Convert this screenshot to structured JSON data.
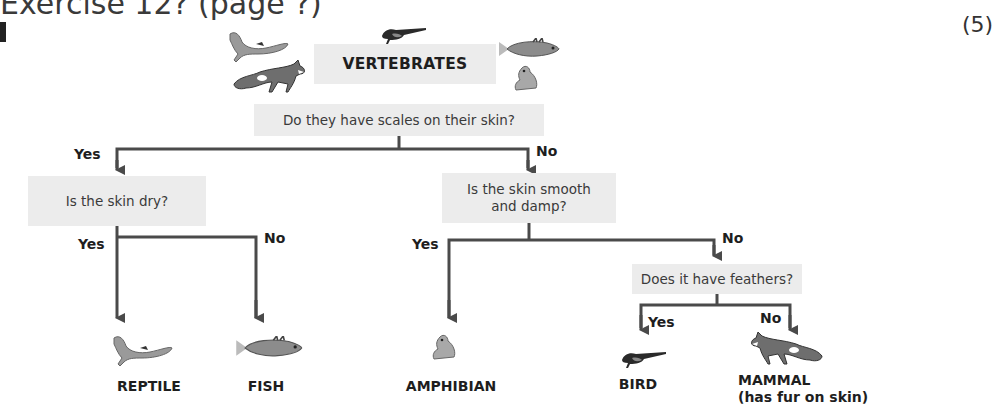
{
  "header": {
    "title_fragment": "Exercise 12?  (page ?)",
    "marks": "(5)"
  },
  "root": {
    "label": "VERTEBRATES"
  },
  "questions": {
    "scales": "Do they have scales on their skin?",
    "dry": "Is the skin dry?",
    "smooth_line1": "Is the skin smooth",
    "smooth_line2": "and damp?",
    "feathers": "Does it have feathers?"
  },
  "branch_labels": {
    "scales_yes": "Yes",
    "scales_no": "No",
    "dry_yes": "Yes",
    "dry_no": "No",
    "smooth_yes": "Yes",
    "smooth_no": "No",
    "feathers_yes": "Yes",
    "feathers_no": "No"
  },
  "leaves": {
    "reptile": "REPTILE",
    "fish": "FISH",
    "amphibian": "AMPHIBIAN",
    "bird": "BIRD",
    "mammal": "MAMMAL",
    "mammal_note": "(has fur on skin)"
  },
  "icons": [
    "lizard-icon",
    "fox-icon",
    "bird-icon",
    "fish-icon",
    "frog-icon"
  ],
  "colors": {
    "box_bg": "#ececec",
    "line": "#4a4a4a",
    "text": "#1e1e1e"
  }
}
